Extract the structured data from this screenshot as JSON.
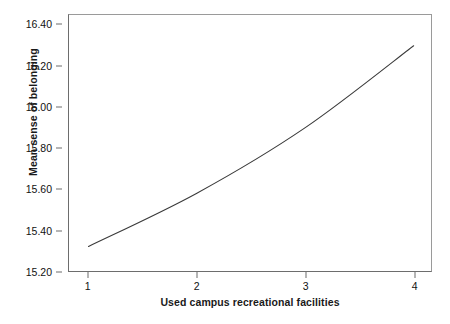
{
  "figure": {
    "background_color": "#ffffff",
    "frame_color": "#8e8e8e",
    "line_color": "#3a3a3a"
  },
  "caption": {
    "text": ""
  },
  "chart_data": {
    "type": "line",
    "title": "",
    "subtitle": "",
    "xlabel": "Used campus recreational facilities",
    "ylabel": "Mean sense of belonging",
    "x": [
      1,
      2,
      3,
      4
    ],
    "values": [
      15.32,
      15.58,
      15.9,
      16.3
    ],
    "series": [
      {
        "name": "Mean sense of belonging",
        "values": [
          15.32,
          15.58,
          15.9,
          16.3
        ]
      }
    ],
    "xlim": [
      0.82,
      4.16
    ],
    "ylim": [
      15.2,
      16.45
    ],
    "xticks": [
      1,
      2,
      3,
      4
    ],
    "xticklabels": [
      "1",
      "2",
      "3",
      "4"
    ],
    "yticks": [
      15.2,
      15.4,
      15.6,
      15.8,
      16.0,
      16.2,
      16.4
    ],
    "yticklabels": [
      "15.20",
      "15.40",
      "15.60",
      "15.80",
      "16.00",
      "16.20",
      "16.40"
    ],
    "grid": false,
    "legend": false,
    "legend_position": "none",
    "annotations": []
  }
}
